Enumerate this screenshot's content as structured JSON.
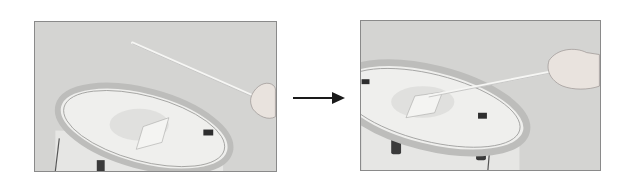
{
  "figure": {
    "panels": [
      {
        "id": "before",
        "description": "Drumstick held above snare drum with square pad placed on drum head",
        "caption": ""
      },
      {
        "id": "after",
        "description": "Drumstick tip pressing square pad on drum head",
        "caption": ""
      }
    ],
    "arrow": {
      "icon": "arrow-right-icon",
      "color": "#1a1a1a"
    },
    "colors": {
      "photo_background": "#d4d4d2",
      "photo_border": "#8a8a8a",
      "page_background": "#ffffff"
    }
  }
}
